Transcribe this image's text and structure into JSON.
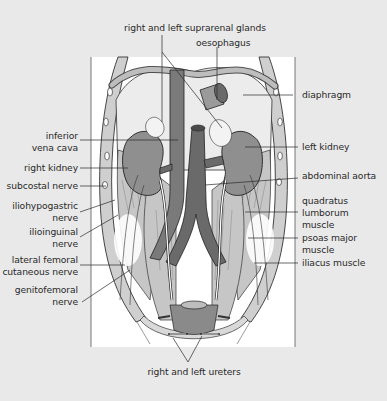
{
  "figure": {
    "colors": {
      "background": "#e9e9e9",
      "panel": "#ffffff",
      "organ": "#8c8c8c",
      "vessel": "#6e6e6e",
      "muscle": "#c9c9c9",
      "outline": "#2a2a2a"
    },
    "labels": {
      "top": {
        "suprarenal": "right and left suprarenal glands",
        "oesophagus": "oesophagus"
      },
      "left": {
        "ivc_1": "inferior",
        "ivc_2": "vena cava",
        "right_kidney": "right kidney",
        "subcostal": "subcostal nerve",
        "iliohypo_1": "iliohypogastric",
        "iliohypo_2": "nerve",
        "ilioing_1": "ilioinguinal",
        "ilioing_2": "nerve",
        "lfcn_1": "lateral femoral",
        "lfcn_2": "cutaneous nerve",
        "genito_1": "genitofemoral",
        "genito_2": "nerve"
      },
      "right": {
        "diaphragm": "diaphragm",
        "left_kidney": "left kidney",
        "aorta": "abdominal aorta",
        "ql_1": "quadratus",
        "ql_2": "lumborum",
        "ql_3": "muscle",
        "psoas_1": "psoas major",
        "psoas_2": "muscle",
        "iliacus": "iliacus muscle"
      },
      "bottom": {
        "ureters": "right and left ureters"
      }
    }
  }
}
